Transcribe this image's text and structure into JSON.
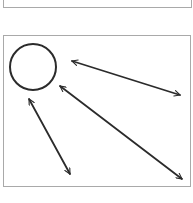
{
  "diagram": {
    "panels": [
      {
        "id": "top",
        "x": 3,
        "y": -2,
        "w": 189,
        "h": 10
      },
      {
        "id": "main",
        "x": 3,
        "y": 35,
        "w": 188,
        "h": 152
      }
    ],
    "colors": {
      "stroke": "#2b2b2b",
      "border": "#a9a9a9",
      "background": "#ffffff"
    },
    "shapes": {
      "circle": {
        "cx": 33,
        "cy": 67,
        "r": 23
      }
    },
    "arrows": [
      {
        "name": "arrow-circle-to-right",
        "x1": 72,
        "y1": 61,
        "x2": 180,
        "y2": 95,
        "heads": "both"
      },
      {
        "name": "arrow-circle-to-bottom-right",
        "x1": 60,
        "y1": 86,
        "x2": 182,
        "y2": 179,
        "heads": "both"
      },
      {
        "name": "arrow-left-vertical",
        "x1": 29,
        "y1": 99,
        "x2": 70,
        "y2": 174,
        "heads": "both"
      }
    ]
  }
}
